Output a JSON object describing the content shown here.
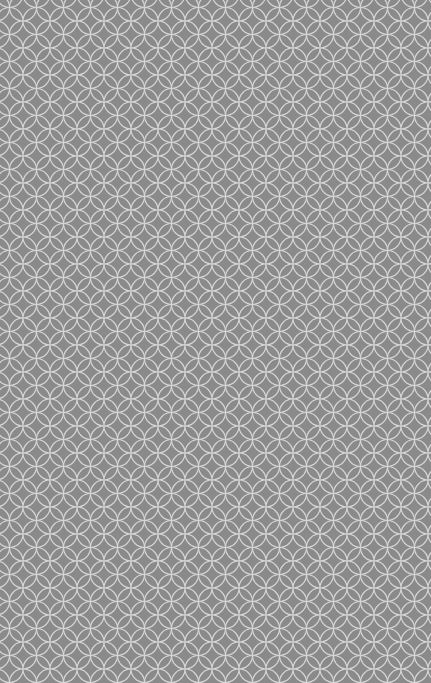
{
  "image": {
    "description": "Seamless gray background with white overlapping-circles lattice pattern",
    "background_color": "#8a8a8a",
    "line_color": "#d8d8d8",
    "pattern_period_px": 27
  }
}
